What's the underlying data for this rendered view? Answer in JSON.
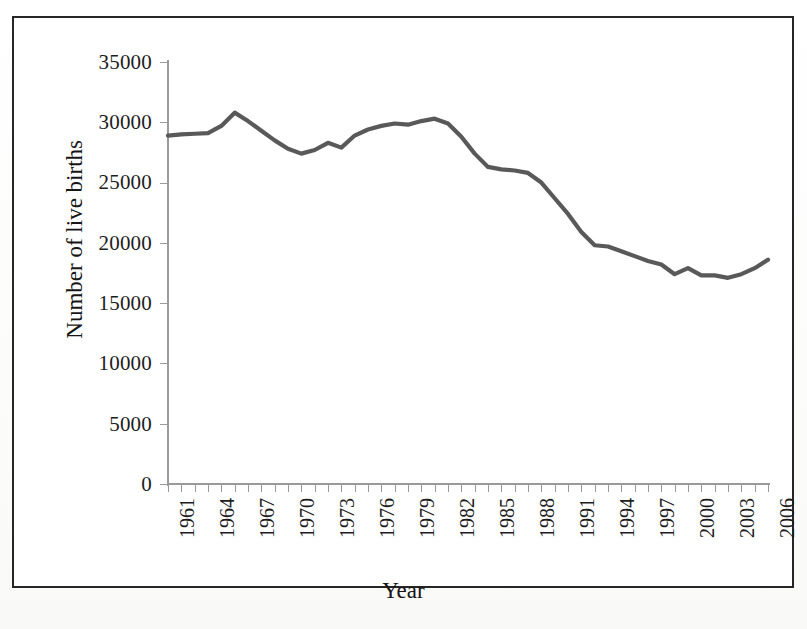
{
  "figure": {
    "background_color": "#ffffff",
    "border_color": "#262626",
    "axis_color": "#9a9a9a",
    "line_color": "#595959",
    "text_color": "#1d1d1d"
  },
  "chart_data": {
    "type": "line",
    "title": "",
    "xlabel": "Year",
    "ylabel": "Number of live births",
    "xlim": [
      1961,
      2006
    ],
    "ylim": [
      0,
      35000
    ],
    "grid": false,
    "legend": null,
    "ytick_labels": [
      "35000",
      "30000",
      "25000",
      "20000",
      "15000",
      "10000",
      "5000",
      "0"
    ],
    "ytick_values": [
      35000,
      30000,
      25000,
      20000,
      15000,
      10000,
      5000,
      0
    ],
    "xtick_labels": [
      "1961",
      "1964",
      "1967",
      "1970",
      "1973",
      "1976",
      "1979",
      "1982",
      "1985",
      "1988",
      "1991",
      "1994",
      "1997",
      "2000",
      "2003",
      "2006"
    ],
    "xtick_values": [
      1961,
      1964,
      1967,
      1970,
      1973,
      1976,
      1979,
      1982,
      1985,
      1988,
      1991,
      1994,
      1997,
      2000,
      2003,
      2006
    ],
    "x": [
      1961,
      1962,
      1963,
      1964,
      1965,
      1966,
      1967,
      1968,
      1969,
      1970,
      1971,
      1972,
      1973,
      1974,
      1975,
      1976,
      1977,
      1978,
      1979,
      1980,
      1981,
      1982,
      1983,
      1984,
      1985,
      1986,
      1987,
      1988,
      1989,
      1990,
      1991,
      1992,
      1993,
      1994,
      1995,
      1996,
      1997,
      1998,
      1999,
      2000,
      2001,
      2002,
      2003,
      2004,
      2005,
      2006
    ],
    "series": [
      {
        "name": "Number of live births",
        "values": [
          28900,
          29000,
          29050,
          29100,
          29700,
          30800,
          30100,
          29300,
          28500,
          27800,
          27400,
          27700,
          28300,
          27900,
          28900,
          29400,
          29700,
          29900,
          29800,
          30100,
          30300,
          29900,
          28800,
          27400,
          26300,
          26100,
          26000,
          25800,
          25000,
          23700,
          22400,
          20900,
          19800,
          19700,
          19300,
          18900,
          18500,
          18200,
          17400,
          17900,
          17300,
          17300,
          17100,
          17400,
          17900,
          18600
        ]
      }
    ]
  },
  "bottom_scrap_text": ""
}
